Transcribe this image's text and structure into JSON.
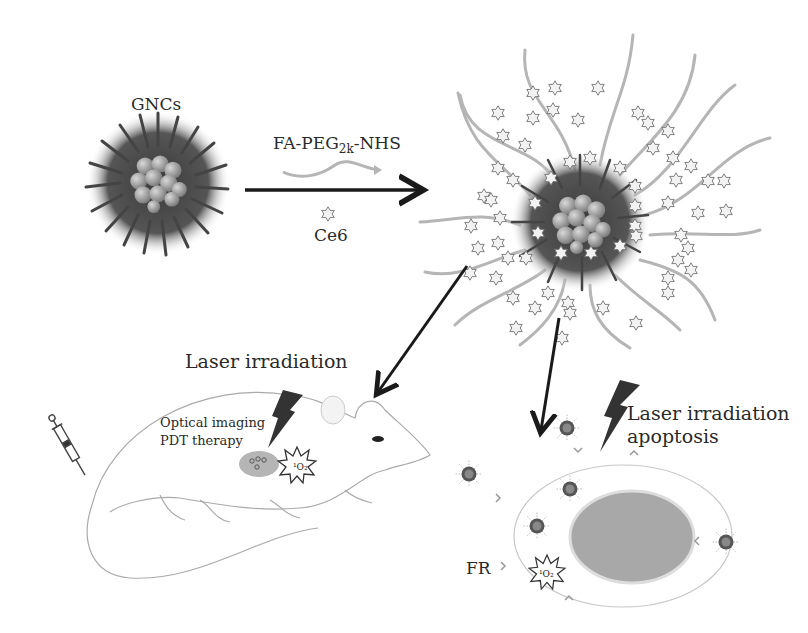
{
  "labels": {
    "gncs": "GNCs",
    "reagent_prefix": "FA-PEG",
    "reagent_sub": "2k",
    "reagent_suffix": "-NHS",
    "ce6": "Ce6",
    "laser_mouse": "Laser irradiation",
    "optical_imaging": "Optical imaging",
    "pdt_therapy": "PDT therapy",
    "laser_cell_line1": "Laser irradiation",
    "laser_cell_line2": "apoptosis",
    "fr": "FR",
    "singlet_oxygen": "¹O₂"
  },
  "colors": {
    "background": "#ffffff",
    "arrow": "#1a1a1a",
    "core_sphere": "#9a9a9a",
    "shell": "#4a4a4a",
    "peg_chain": "#b5b5b5",
    "star_fill": "#f2f2f2",
    "star_stroke": "#7a7a7a",
    "lightning": "#3a3a3a",
    "nucleus": "#a8a8a8",
    "outline": "#9a9a9a"
  },
  "nodes": [
    {
      "id": "gncs",
      "label": "GNCs"
    },
    {
      "id": "fa-peg-nhs",
      "label": "FA-PEG2k-NHS"
    },
    {
      "id": "ce6",
      "label": "Ce6"
    },
    {
      "id": "functionalized-nanocluster",
      "label": ""
    },
    {
      "id": "mouse",
      "label": "Laser irradiation / Optical imaging / PDT therapy"
    },
    {
      "id": "cancer-cell",
      "label": "Laser irradiation apoptosis"
    }
  ],
  "edges": [
    {
      "from": "gncs",
      "to": "functionalized-nanocluster"
    },
    {
      "from": "functionalized-nanocluster",
      "to": "mouse"
    },
    {
      "from": "functionalized-nanocluster",
      "to": "cancer-cell"
    }
  ]
}
